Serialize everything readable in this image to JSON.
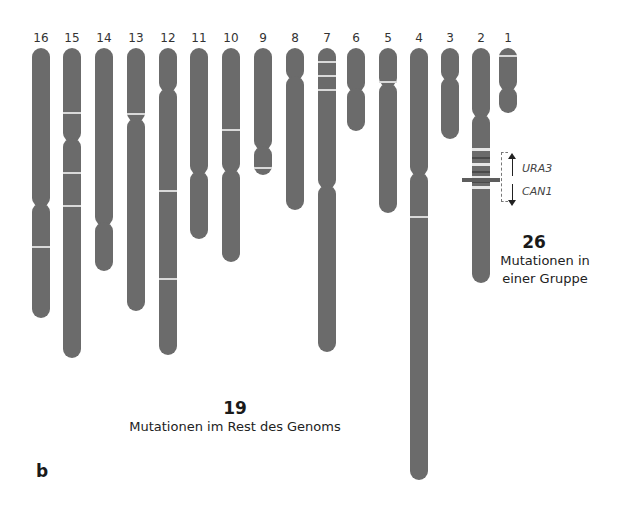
{
  "figure": {
    "panel_label": "b",
    "cluster": {
      "count": "26",
      "text_line1": "Mutationen in",
      "text_line2": "einer Gruppe",
      "genes": [
        "URA3",
        "CAN1"
      ]
    },
    "rest": {
      "count": "19",
      "text": "Mutationen im Rest des Genoms"
    }
  },
  "chromosomes": [
    {
      "label": "16",
      "x": 41,
      "top": 48,
      "centromere": 205,
      "bottom": 318,
      "bands": [
        246
      ]
    },
    {
      "label": "15",
      "x": 72,
      "top": 48,
      "centromere": 140,
      "bottom": 358,
      "bands": [
        112,
        172,
        205
      ]
    },
    {
      "label": "14",
      "x": 104,
      "top": 48,
      "centromere": 224,
      "bottom": 271,
      "bands": []
    },
    {
      "label": "13",
      "x": 136,
      "top": 48,
      "centromere": 120,
      "bottom": 311,
      "bands": [
        113
      ]
    },
    {
      "label": "12",
      "x": 168,
      "top": 48,
      "centromere": 90,
      "bottom": 355,
      "bands": [
        190,
        278
      ]
    },
    {
      "label": "11",
      "x": 199,
      "top": 48,
      "centromere": 173,
      "bottom": 239,
      "bands": []
    },
    {
      "label": "10",
      "x": 231,
      "top": 48,
      "centromere": 171,
      "bottom": 262,
      "bands": [
        129
      ]
    },
    {
      "label": "9",
      "x": 263,
      "top": 48,
      "centromere": 148,
      "bottom": 175,
      "bands": [
        167
      ]
    },
    {
      "label": "8",
      "x": 295,
      "top": 48,
      "centromere": 78,
      "bottom": 210,
      "bands": []
    },
    {
      "label": "7",
      "x": 327,
      "top": 48,
      "centromere": 187,
      "bottom": 352,
      "bands": [
        61,
        75,
        89
      ]
    },
    {
      "label": "6",
      "x": 356,
      "top": 48,
      "centromere": 90,
      "bottom": 131,
      "bands": []
    },
    {
      "label": "5",
      "x": 388,
      "top": 48,
      "centromere": 85,
      "bottom": 213,
      "bands": [
        81
      ]
    },
    {
      "label": "4",
      "x": 419,
      "top": 48,
      "centromere": 174,
      "bottom": 480,
      "bands": [
        216
      ]
    },
    {
      "label": "3",
      "x": 450,
      "top": 48,
      "centromere": 79,
      "bottom": 139,
      "bands": []
    },
    {
      "label": "2",
      "x": 481,
      "top": 48,
      "centromere": 116,
      "bottom": 283,
      "bands": [
        148,
        157,
        163,
        171,
        176,
        181,
        186
      ]
    },
    {
      "label": "1",
      "x": 508,
      "top": 48,
      "centromere": 89,
      "bottom": 113,
      "bands": [
        55
      ]
    }
  ],
  "colors": {
    "chromosome": "#6b6b6b",
    "band": "#d9d9d9",
    "text": "#1a1a1a"
  }
}
